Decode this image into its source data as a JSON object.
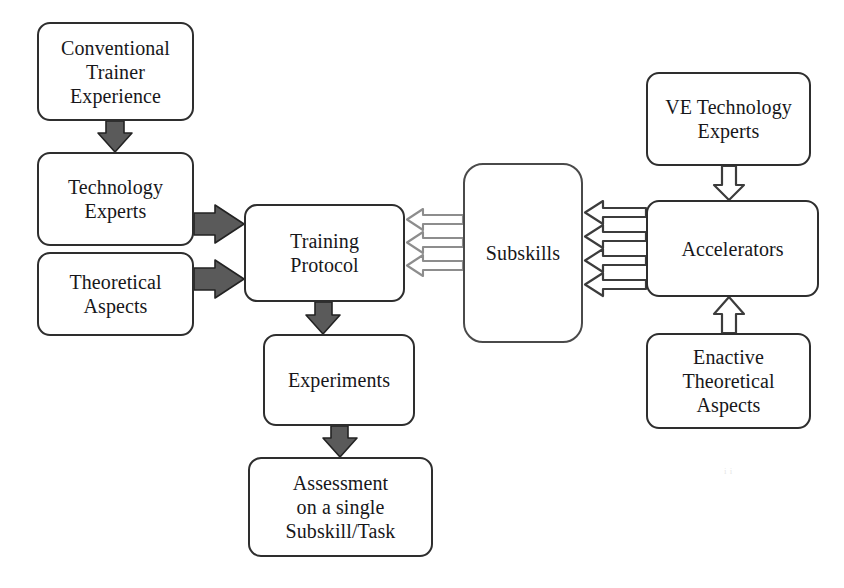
{
  "diagram": {
    "background_color": "#ffffff",
    "box_border_color": "#2e2e2e",
    "solid_arrow_fill": "#5a5a5a",
    "solid_arrow_stroke": "#222222",
    "hollow_arrow_left_stroke": "#8a8a8a",
    "hollow_arrow_right_stroke": "#3c3c3c",
    "dot_stroke_color": "#6a6a6a",
    "artifact_text": "i i"
  },
  "nodes": [
    {
      "id": "conventional_trainer_experience",
      "label": "Conventional\nTrainer\nExperience",
      "x": 37,
      "y": 22,
      "w": 157,
      "h": 99,
      "font_size": 20
    },
    {
      "id": "technology_experts",
      "label": "Technology\nExperts",
      "x": 37,
      "y": 152,
      "w": 157,
      "h": 94,
      "font_size": 20
    },
    {
      "id": "theoretical_aspects",
      "label": "Theoretical\nAspects",
      "x": 37,
      "y": 252,
      "w": 157,
      "h": 84,
      "font_size": 20
    },
    {
      "id": "training_protocol",
      "label": "Training\nProtocol",
      "x": 244,
      "y": 204,
      "w": 161,
      "h": 98,
      "font_size": 20
    },
    {
      "id": "experiments",
      "label": "Experiments",
      "x": 263,
      "y": 334,
      "w": 152,
      "h": 92,
      "font_size": 20
    },
    {
      "id": "assessment",
      "label": "Assessment\non a single\nSubskill/Task",
      "x": 248,
      "y": 457,
      "w": 185,
      "h": 100,
      "font_size": 20
    },
    {
      "id": "subskills",
      "label": "Subskills",
      "x": 463,
      "y": 163,
      "w": 120,
      "h": 180,
      "font_size": 20
    },
    {
      "id": "ve_technology_experts",
      "label": "VE Technology\nExperts",
      "x": 646,
      "y": 72,
      "w": 165,
      "h": 94,
      "font_size": 20
    },
    {
      "id": "accelerators",
      "label": "Accelerators",
      "x": 646,
      "y": 200,
      "w": 173,
      "h": 97,
      "font_size": 20
    },
    {
      "id": "enactive_theoretical_aspects",
      "label": "Enactive\nTheoretical\nAspects",
      "x": 646,
      "y": 333,
      "w": 165,
      "h": 96,
      "font_size": 20
    }
  ],
  "subskill_dots": [
    {
      "cx": 496,
      "cy": 202,
      "r": 11
    },
    {
      "cx": 543,
      "cy": 183,
      "r": 11
    },
    {
      "cx": 540,
      "cy": 213,
      "r": 11
    },
    {
      "cx": 500,
      "cy": 291,
      "r": 11
    },
    {
      "cx": 543,
      "cy": 305,
      "r": 11
    },
    {
      "cx": 505,
      "cy": 325,
      "r": 11
    }
  ],
  "connections": [
    {
      "id": "conventional-to-technology",
      "from": "conventional_trainer_experience",
      "to": "technology_experts",
      "style": "solid",
      "direction": "down"
    },
    {
      "id": "technology-to-protocol",
      "from": "technology_experts",
      "to": "training_protocol",
      "style": "solid",
      "direction": "right"
    },
    {
      "id": "theoretical-to-protocol",
      "from": "theoretical_aspects",
      "to": "training_protocol",
      "style": "solid",
      "direction": "right"
    },
    {
      "id": "protocol-to-experiments",
      "from": "training_protocol",
      "to": "experiments",
      "style": "solid",
      "direction": "down"
    },
    {
      "id": "experiments-to-assessment",
      "from": "experiments",
      "to": "assessment",
      "style": "solid",
      "direction": "down"
    },
    {
      "id": "subskills-to-protocol",
      "from": "subskills",
      "to": "training_protocol",
      "style": "hollow",
      "direction": "left",
      "count": 3
    },
    {
      "id": "accelerators-to-subskills",
      "from": "accelerators",
      "to": "subskills",
      "style": "hollow",
      "direction": "left",
      "count": 4
    },
    {
      "id": "ve-experts-to-accelerators",
      "from": "ve_technology_experts",
      "to": "accelerators",
      "style": "hollow",
      "direction": "down",
      "count": 1
    },
    {
      "id": "enactive-to-accelerators",
      "from": "enactive_theoretical_aspects",
      "to": "accelerators",
      "style": "hollow",
      "direction": "up",
      "count": 1
    }
  ]
}
